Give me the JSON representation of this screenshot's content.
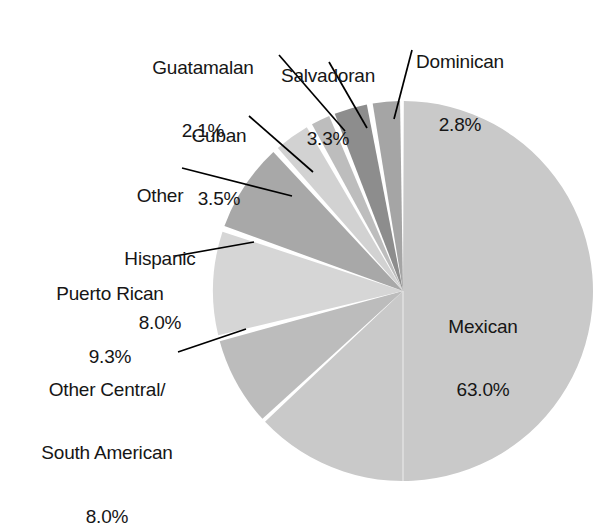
{
  "chart_data": {
    "type": "pie",
    "title": "",
    "subtitle": "",
    "xlabel": "",
    "ylabel": "",
    "legend_position": "none",
    "grid": false,
    "value_unit": "%",
    "total": 100.0,
    "start_angle_deg": 0,
    "direction": "clockwise",
    "categories": [
      "Mexican",
      "Other Central/\nSouth American",
      "Puerto Rican",
      "Other Hispanic",
      "Cuban",
      "Guatamalan",
      "Salvadoran",
      "Dominican"
    ],
    "values": [
      63.0,
      8.0,
      9.3,
      8.0,
      3.5,
      2.1,
      3.3,
      2.8
    ],
    "slices": [
      {
        "name": "Mexican",
        "label": "Mexican",
        "value": 63.0,
        "value_text": "63.0%",
        "color": "#c9c9c9",
        "label_placement": "inside"
      },
      {
        "name": "Other Central/South American",
        "label_line1": "Other Central/",
        "label_line2": "South American",
        "value": 8.0,
        "value_text": "8.0%",
        "color": "#bcbcbc",
        "label_placement": "callout"
      },
      {
        "name": "Puerto Rican",
        "label": "Puerto Rican",
        "value": 9.3,
        "value_text": "9.3%",
        "color": "#d6d6d6",
        "label_placement": "callout"
      },
      {
        "name": "Other Hispanic",
        "label_line1": "Other",
        "label_line2": "Hispanic",
        "value": 8.0,
        "value_text": "8.0%",
        "color": "#a8a8a8",
        "label_placement": "callout"
      },
      {
        "name": "Cuban",
        "label": "Cuban",
        "value": 3.5,
        "value_text": "3.5%",
        "color": "#d2d2d2",
        "label_placement": "callout"
      },
      {
        "name": "Guatamalan",
        "label": "Guatamalan",
        "value": 2.1,
        "value_text": "2.1%",
        "color": "#bdbdbd",
        "label_placement": "callout"
      },
      {
        "name": "Salvadoran",
        "label": "Salvadoran",
        "value": 3.3,
        "value_text": "3.3%",
        "color": "#8d8d8d",
        "label_placement": "callout"
      },
      {
        "name": "Dominican",
        "label": "Dominican",
        "value": 2.8,
        "value_text": "2.8%",
        "color": "#a5a5a5",
        "label_placement": "callout"
      }
    ],
    "colors": {
      "background": "#ffffff",
      "slice_separator": "#ffffff",
      "leader_line": "#000000",
      "text": "#161616"
    }
  },
  "labels": {
    "mexican": {
      "name": "Mexican",
      "pct": "63.0%"
    },
    "dominican": {
      "name": "Dominican",
      "pct": "2.8%"
    },
    "salvadoran": {
      "name": "Salvadoran",
      "pct": "3.3%"
    },
    "guatamalan": {
      "name": "Guatamalan",
      "pct": "2.1%"
    },
    "cuban": {
      "name": "Cuban",
      "pct": "3.5%"
    },
    "other_hispanic": {
      "name_line1": "Other",
      "name_line2": "Hispanic",
      "pct": "8.0%"
    },
    "puerto_rican": {
      "name": "Puerto Rican",
      "pct": "9.3%"
    },
    "other_csa": {
      "name_line1": "Other Central/",
      "name_line2": "South American",
      "pct": "8.0%"
    }
  }
}
